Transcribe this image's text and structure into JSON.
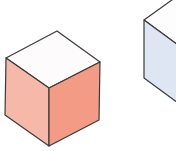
{
  "diagram": {
    "type": "isometric-cubes",
    "stroke": "#3a3a3a",
    "cubes": [
      {
        "name": "red-cube",
        "top_color": "#fdfbfb",
        "left_color": "#f6b9a9",
        "right_color": "#f39b84",
        "points": {
          "top": [
            57,
            31
          ],
          "lt": [
            6,
            58
          ],
          "rt": [
            100,
            62
          ],
          "c": [
            49,
            88
          ],
          "lb": [
            5,
            115
          ],
          "rb": [
            99,
            120
          ],
          "b": [
            49,
            146
          ]
        }
      },
      {
        "name": "blue-cube",
        "top_color": "#fdfdfe",
        "left_color": "#dfe6f3",
        "right_color": "#c9d4ea",
        "points": {
          "top": [
            183,
            -8
          ],
          "lt": [
            144,
            20
          ],
          "rt": [
            230,
            22
          ],
          "c": [
            178,
            45
          ],
          "lb": [
            144,
            78
          ],
          "rb": [
            230,
            80
          ],
          "b": [
            178,
            103
          ]
        }
      }
    ]
  }
}
